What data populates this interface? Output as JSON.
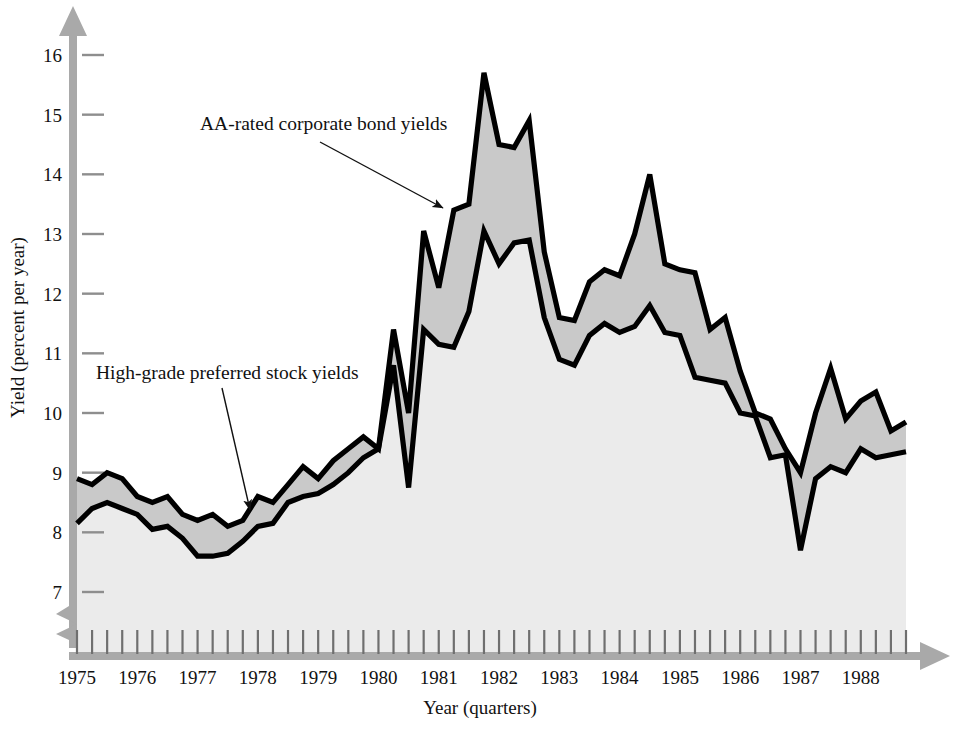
{
  "figure": {
    "background_color": "#ffffff",
    "axis_color": "#a9a9a9",
    "line_color": "#000000",
    "band_fill_color": "#c9c9c9",
    "under_fill_color": "#ebebeb"
  },
  "axes": {
    "y_title": "Yield (percent per year)",
    "x_title": "Year (quarters)",
    "y_ticks": [
      "7",
      "8",
      "9",
      "10",
      "11",
      "12",
      "13",
      "14",
      "15",
      "16"
    ],
    "x_ticks": [
      "1975",
      "1976",
      "1977",
      "1978",
      "1979",
      "1980",
      "1981",
      "1982",
      "1983",
      "1984",
      "1985",
      "1986",
      "1987",
      "1988"
    ],
    "y_axis_break": true,
    "arrow_heads": true
  },
  "annotations": [
    {
      "name": "aa-rated-corporate-bond-yields",
      "text": "AA-rated corporate bond yields",
      "text_x": 200,
      "text_y": 130,
      "arrow_from_x": 320,
      "arrow_from_y": 142,
      "arrow_to_x": 443,
      "arrow_to_y": 208
    },
    {
      "name": "high-grade-preferred-stock-yields",
      "text": "High-grade preferred stock yields",
      "text_x": 96,
      "text_y": 379,
      "arrow_from_x": 222,
      "arrow_from_y": 388,
      "arrow_to_x": 250,
      "arrow_to_y": 510
    }
  ],
  "chart_data": {
    "type": "area",
    "title": "",
    "subtitle": "",
    "xlabel": "Year (quarters)",
    "ylabel": "Yield (percent per year)",
    "xlim": [
      "1975Q1",
      "1988Q4"
    ],
    "ylim": [
      6.6,
      16.3
    ],
    "grid": false,
    "legend": "annotations",
    "x_tick_labels": [
      "1975",
      "1976",
      "1977",
      "1978",
      "1979",
      "1980",
      "1981",
      "1982",
      "1983",
      "1984",
      "1985",
      "1986",
      "1987",
      "1988"
    ],
    "y_tick_labels": [
      7,
      8,
      9,
      10,
      11,
      12,
      13,
      14,
      15,
      16
    ],
    "x": [
      "1975Q1",
      "1975Q2",
      "1975Q3",
      "1975Q4",
      "1976Q1",
      "1976Q2",
      "1976Q3",
      "1976Q4",
      "1977Q1",
      "1977Q2",
      "1977Q3",
      "1977Q4",
      "1978Q1",
      "1978Q2",
      "1978Q3",
      "1978Q4",
      "1979Q1",
      "1979Q2",
      "1979Q3",
      "1979Q4",
      "1980Q1",
      "1980Q2",
      "1980Q3",
      "1980Q4",
      "1981Q1",
      "1981Q2",
      "1981Q3",
      "1981Q4",
      "1982Q1",
      "1982Q2",
      "1982Q3",
      "1982Q4",
      "1983Q1",
      "1983Q2",
      "1983Q3",
      "1983Q4",
      "1984Q1",
      "1984Q2",
      "1984Q3",
      "1984Q4",
      "1985Q1",
      "1985Q2",
      "1985Q3",
      "1985Q4",
      "1986Q1",
      "1986Q2",
      "1986Q3",
      "1986Q4",
      "1987Q1",
      "1987Q2",
      "1987Q3",
      "1987Q4",
      "1988Q1",
      "1988Q2",
      "1988Q3",
      "1988Q4"
    ],
    "series": [
      {
        "name": "AA-rated corporate bond yields",
        "values": [
          8.9,
          8.8,
          9.0,
          8.9,
          8.6,
          8.5,
          8.6,
          8.3,
          8.2,
          8.3,
          8.1,
          8.2,
          8.6,
          8.5,
          8.8,
          9.1,
          8.9,
          9.2,
          9.4,
          9.6,
          9.4,
          11.4,
          10.0,
          13.05,
          12.1,
          13.4,
          13.5,
          15.7,
          14.5,
          14.45,
          14.9,
          12.7,
          11.6,
          11.55,
          12.2,
          12.4,
          12.3,
          13.0,
          14.0,
          12.5,
          12.4,
          12.35,
          11.4,
          11.6,
          10.7,
          10.0,
          9.9,
          9.4,
          9.0,
          10.0,
          10.75,
          9.9,
          10.2,
          10.35,
          9.7,
          9.85
        ]
      },
      {
        "name": "High-grade preferred stock yields",
        "values": [
          8.15,
          8.4,
          8.5,
          8.4,
          8.3,
          8.05,
          8.1,
          7.9,
          7.6,
          7.6,
          7.65,
          7.85,
          8.1,
          8.15,
          8.5,
          8.6,
          8.65,
          8.8,
          9.0,
          9.25,
          9.4,
          10.8,
          8.75,
          11.4,
          11.15,
          11.1,
          11.7,
          13.05,
          12.5,
          12.85,
          12.9,
          11.6,
          10.9,
          10.8,
          11.3,
          11.5,
          11.35,
          11.45,
          11.8,
          11.35,
          11.3,
          10.6,
          10.55,
          10.5,
          10.0,
          9.95,
          9.25,
          9.3,
          7.7,
          8.9,
          9.1,
          9.0,
          9.4,
          9.25,
          9.3,
          9.35
        ]
      }
    ]
  }
}
